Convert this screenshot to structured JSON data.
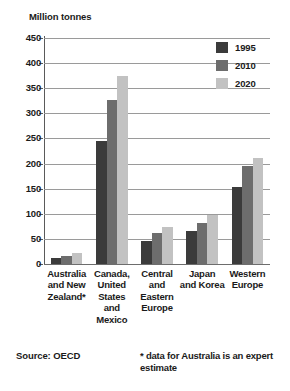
{
  "chart_data": {
    "type": "bar",
    "title": "",
    "ylabel": "Million tonnes",
    "xlabel": "",
    "ylim": [
      0,
      450
    ],
    "ytick_step": 50,
    "yticks": [
      "450",
      "400",
      "350",
      "300",
      "250",
      "200",
      "150",
      "100",
      "50",
      "0"
    ],
    "grid": true,
    "legend_position": "top-right",
    "categories": [
      "Australia and New Zealand*",
      "Canada, United States and Mexico",
      "Central and Eastern Europe",
      "Japan and Korea",
      "Western Europe"
    ],
    "category_lines": [
      [
        "Australia",
        "and New",
        "Zealand*"
      ],
      [
        "Canada,",
        "United",
        "States",
        "and",
        "Mexico"
      ],
      [
        "Central",
        "and",
        "Eastern",
        "Europe"
      ],
      [
        "Japan",
        "and Korea"
      ],
      [
        "Western",
        "Europe"
      ]
    ],
    "series": [
      {
        "name": "1995",
        "color": "#3b3b3b",
        "values": [
          12,
          244,
          46,
          66,
          153
        ]
      },
      {
        "name": "2010",
        "color": "#6d6d6d",
        "values": [
          16,
          327,
          61,
          82,
          195
        ]
      },
      {
        "name": "2020",
        "color": "#c2c2c2",
        "values": [
          21,
          375,
          73,
          97,
          212
        ]
      }
    ]
  },
  "notes": {
    "source": "Source: OECD",
    "footnote": "* data for Australia is an expert estimate"
  }
}
